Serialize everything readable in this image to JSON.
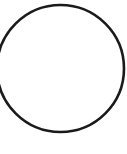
{
  "figure": {
    "name": "circle-outline",
    "width": 127,
    "height": 154,
    "background_color": "#ffffff",
    "shapes": [
      {
        "kind": "circle",
        "center_x": 60.5,
        "center_y": 68.5,
        "radius": 63.5,
        "stroke_color": "#1a1a1a",
        "stroke_width": 2.6,
        "fill": "none",
        "clipped_edges": "left"
      }
    ],
    "labels": [],
    "caption": ""
  }
}
